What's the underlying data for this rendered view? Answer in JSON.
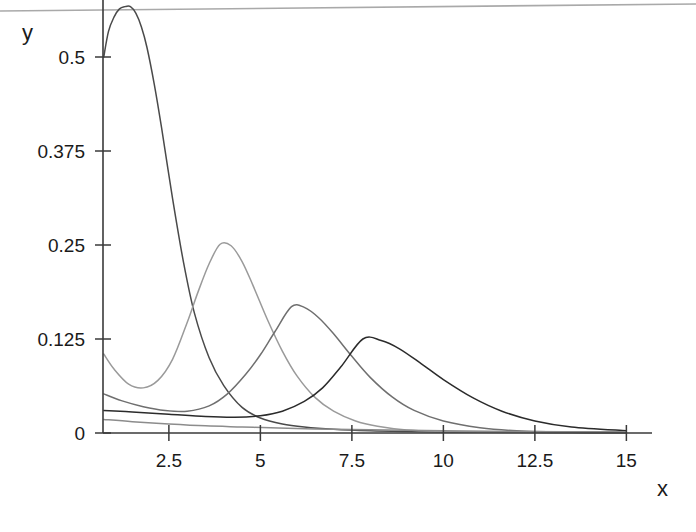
{
  "chart_data": {
    "type": "line",
    "title": "",
    "xlabel": "x",
    "ylabel": "y",
    "xlim": [
      0.7,
      15
    ],
    "ylim": [
      0,
      0.576
    ],
    "grid": false,
    "legend": null,
    "xticks": [
      2.5,
      5,
      7.5,
      10,
      12.5,
      15
    ],
    "xtick_labels": [
      "2.5",
      "5",
      "7.5",
      "10",
      "12.5",
      "15"
    ],
    "yticks": [
      0,
      0.125,
      0.25,
      0.375,
      0.5
    ],
    "ytick_labels": [
      "0",
      "0.125",
      "0.25",
      "0.375",
      "0.5"
    ],
    "series": [
      {
        "name": "curve-1",
        "color": "#4a4a4a",
        "peak_x": 1.45,
        "peak_y": 0.567,
        "start_y": 0.5,
        "x": [
          0.72,
          0.85,
          1.0,
          1.15,
          1.3,
          1.45,
          1.6,
          1.75,
          1.9,
          2.1,
          2.3,
          2.6,
          2.9,
          3.2,
          3.6,
          4.0,
          4.5,
          5.0,
          5.6,
          6.2,
          7.0,
          8.0,
          9.0,
          10.5,
          12.0,
          13.5,
          15.0
        ],
        "y": [
          0.5,
          0.534,
          0.553,
          0.564,
          0.567,
          0.567,
          0.558,
          0.54,
          0.513,
          0.464,
          0.406,
          0.312,
          0.227,
          0.159,
          0.1,
          0.063,
          0.034,
          0.02,
          0.012,
          0.008,
          0.005,
          0.003,
          0.002,
          0.001,
          0.001,
          0.0005,
          0.0003
        ]
      },
      {
        "name": "curve-2",
        "color": "#9a9a9a",
        "peak_x": 3.9,
        "peak_y": 0.251,
        "start_y": 0.105,
        "x": [
          0.72,
          1.0,
          1.4,
          1.8,
          2.2,
          2.6,
          3.0,
          3.3,
          3.6,
          3.9,
          4.2,
          4.5,
          4.8,
          5.2,
          5.6,
          6.0,
          6.5,
          7.0,
          7.6,
          8.2,
          9.0,
          10.0,
          11.0,
          12.5,
          14.0,
          15.0
        ],
        "y": [
          0.105,
          0.085,
          0.065,
          0.06,
          0.07,
          0.098,
          0.147,
          0.188,
          0.225,
          0.251,
          0.249,
          0.228,
          0.196,
          0.15,
          0.109,
          0.076,
          0.047,
          0.029,
          0.016,
          0.009,
          0.004,
          0.002,
          0.001,
          0.0006,
          0.0003,
          0.0002
        ]
      },
      {
        "name": "curve-3",
        "color": "#6f6f6f",
        "peak_x": 5.85,
        "peak_y": 0.168,
        "start_y": 0.052,
        "x": [
          0.72,
          1.2,
          1.8,
          2.4,
          3.0,
          3.6,
          4.1,
          4.6,
          5.0,
          5.4,
          5.85,
          6.2,
          6.6,
          7.0,
          7.5,
          8.0,
          8.6,
          9.2,
          10.0,
          11.0,
          12.0,
          13.5,
          15.0
        ],
        "y": [
          0.052,
          0.043,
          0.035,
          0.03,
          0.029,
          0.036,
          0.052,
          0.078,
          0.104,
          0.135,
          0.168,
          0.167,
          0.153,
          0.132,
          0.102,
          0.074,
          0.048,
          0.03,
          0.016,
          0.007,
          0.003,
          0.001,
          0.0006
        ]
      },
      {
        "name": "curve-4",
        "color": "#2b2b2b",
        "peak_x": 7.8,
        "peak_y": 0.125,
        "start_y": 0.03,
        "x": [
          0.72,
          1.5,
          2.5,
          3.5,
          4.3,
          5.0,
          5.6,
          6.2,
          6.7,
          7.2,
          7.8,
          8.3,
          8.8,
          9.4,
          10.0,
          10.8,
          11.6,
          12.5,
          13.5,
          15.0
        ],
        "y": [
          0.03,
          0.028,
          0.025,
          0.022,
          0.021,
          0.023,
          0.029,
          0.042,
          0.06,
          0.088,
          0.125,
          0.123,
          0.112,
          0.092,
          0.071,
          0.047,
          0.029,
          0.016,
          0.008,
          0.003
        ]
      },
      {
        "name": "curve-5-baseline",
        "color": "#8c8c8c",
        "peak_x": 0.72,
        "peak_y": 0.018,
        "start_y": 0.018,
        "x": [
          0.72,
          1.5,
          2.5,
          3.5,
          4.5,
          5.5,
          7.0,
          8.5,
          10.0,
          12.0,
          15.0
        ],
        "y": [
          0.018,
          0.015,
          0.012,
          0.0095,
          0.008,
          0.0065,
          0.005,
          0.004,
          0.003,
          0.002,
          0.0015
        ]
      }
    ],
    "axes_color": "#3a3a3a",
    "background": "#ffffff"
  },
  "geometry": {
    "plot_left": 103,
    "plot_bottom": 433,
    "plot_right": 648,
    "x_per_unit": 36.6,
    "y_per_unit": 752
  },
  "labels": {
    "y_axis": "y",
    "x_axis": "x"
  }
}
